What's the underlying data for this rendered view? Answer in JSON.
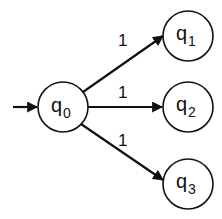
{
  "diagram": {
    "type": "state-machine",
    "states": [
      {
        "id": "q0",
        "base": "q",
        "sub": "0",
        "initial": true
      },
      {
        "id": "q1",
        "base": "q",
        "sub": "1"
      },
      {
        "id": "q2",
        "base": "q",
        "sub": "2"
      },
      {
        "id": "q3",
        "base": "q",
        "sub": "3"
      }
    ],
    "transitions": [
      {
        "from": "q0",
        "to": "q1",
        "label": "1"
      },
      {
        "from": "q0",
        "to": "q2",
        "label": "1"
      },
      {
        "from": "q0",
        "to": "q3",
        "label": "1"
      }
    ]
  }
}
